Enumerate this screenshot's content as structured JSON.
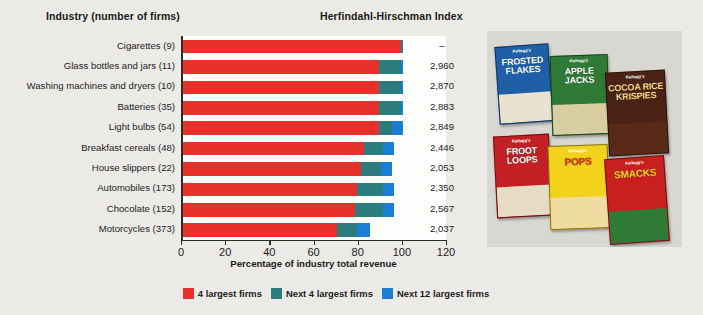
{
  "headers": {
    "industry": "Industry (number of firms)",
    "hhi": "Herfindahl-Hirschman Index"
  },
  "chart_data": {
    "type": "bar",
    "orientation": "horizontal",
    "stacked": true,
    "title": "Herfindahl-Hirschman Index",
    "xlabel": "Percentage of industry total revenue",
    "ylabel": "Industry (number of firms)",
    "xlim": [
      0,
      120
    ],
    "xticks": [
      0,
      20,
      40,
      60,
      80,
      100,
      120
    ],
    "grid": false,
    "legend_position": "bottom",
    "legend": [
      "4 largest firms",
      "Next 4 largest firms",
      "Next 12 largest firms"
    ],
    "colors": {
      "four_largest": "#e8312a",
      "next_four": "#2c7b7d",
      "next_twelve": "#1a7ed4",
      "background": "#eceae6",
      "plot_background": "#fdfdfb"
    },
    "categories": [
      "Cigarettes  (9)",
      "Glass bottles and jars  (11)",
      "Washing machines and dryers  (10)",
      "Batteries  (35)",
      "Light bulbs  (54)",
      "Breakfast cereals  (48)",
      "House slippers  (22)",
      "Automobiles  (173)",
      "Chocolate  (152)",
      "Motorcycles  (373)"
    ],
    "series": [
      {
        "name": "4 largest firms",
        "color": "#e8312a",
        "values": [
          99,
          89,
          89,
          89,
          89,
          82,
          81,
          79,
          78,
          70
        ]
      },
      {
        "name": "Next 4 largest firms",
        "color": "#2c7b7d",
        "values": [
          1,
          10,
          10,
          10,
          6,
          9,
          9,
          12,
          13,
          9
        ]
      },
      {
        "name": "Next 12 largest firms",
        "color": "#1a7ed4",
        "values": [
          0,
          1,
          1,
          1,
          5,
          5,
          5,
          5,
          5,
          6
        ]
      }
    ],
    "hhi_values": [
      "–",
      "2,960",
      "2,870",
      "2,883",
      "2,849",
      "2,446",
      "2,053",
      "2,350",
      "2,567",
      "2,037"
    ]
  },
  "photo": {
    "alt_name": "kelloggs-cereal-boxes-photo",
    "boxes": [
      {
        "brand": "Kellogg's",
        "name": "FROSTED FLAKES"
      },
      {
        "brand": "Kellogg's",
        "name": "APPLE JACKS"
      },
      {
        "brand": "Kellogg's",
        "name": "COCOA RICE KRISPIES"
      },
      {
        "brand": "Kellogg's",
        "name": "FROOT LOOPS"
      },
      {
        "brand": "Kellogg's",
        "name": "POPS"
      },
      {
        "brand": "Kellogg's",
        "name": "SMACKS"
      }
    ]
  }
}
